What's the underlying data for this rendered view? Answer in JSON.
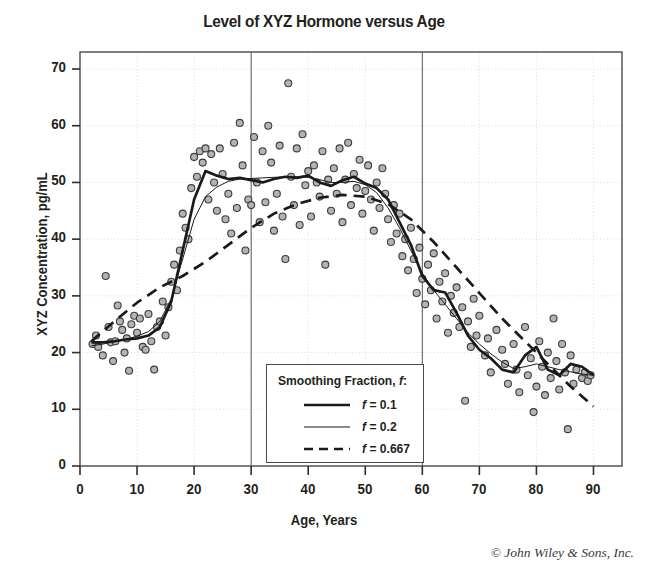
{
  "chart_data": {
    "type": "scatter",
    "title": "Level of XYZ Hormone versus Age",
    "xlabel": "Age, Years",
    "ylabel": "XYZ Concentration, pg/mL",
    "xlim": [
      0,
      95
    ],
    "ylim": [
      0,
      73
    ],
    "xticks": [
      0,
      10,
      20,
      30,
      40,
      50,
      60,
      70,
      80,
      90
    ],
    "yticks": [
      0,
      10,
      20,
      30,
      40,
      50,
      60,
      70
    ],
    "grid": true,
    "legend_position": "lower-center",
    "credit": "© John Wiley & Sons, Inc.",
    "marker": {
      "shape": "circle",
      "fill": "#b3b3b3",
      "edge": "#3c3c3c",
      "size": 7
    },
    "legend": {
      "title": "Smoothing Fraction, f:",
      "title_plain": "Smoothing Fraction, ",
      "title_italic": "f",
      "title_suffix": ":",
      "entries": [
        {
          "label": "f = 0.1",
          "italic": "f",
          "rest": " = 0.1",
          "style": "thick-solid",
          "width": 2.6,
          "dash": "none"
        },
        {
          "label": "f = 0.2",
          "italic": "f",
          "rest": " = 0.2",
          "style": "thin-solid",
          "width": 1.0,
          "dash": "none"
        },
        {
          "label": "f = 0.667",
          "italic": "f",
          "rest": " = 0.667",
          "style": "dashed",
          "width": 2.6,
          "dash": "9 6"
        }
      ]
    },
    "scatter": [
      [
        2.2,
        21.5
      ],
      [
        2.8,
        23.0
      ],
      [
        3.2,
        21.0
      ],
      [
        4.0,
        19.5
      ],
      [
        4.5,
        33.5
      ],
      [
        5.0,
        24.5
      ],
      [
        5.4,
        21.8
      ],
      [
        5.8,
        18.5
      ],
      [
        6.2,
        22.0
      ],
      [
        6.6,
        28.3
      ],
      [
        7.0,
        25.5
      ],
      [
        7.4,
        24.0
      ],
      [
        7.8,
        20.0
      ],
      [
        8.2,
        22.5
      ],
      [
        8.6,
        16.8
      ],
      [
        9.0,
        25.0
      ],
      [
        9.5,
        26.5
      ],
      [
        10.0,
        23.5
      ],
      [
        10.5,
        26.0
      ],
      [
        11.0,
        21.0
      ],
      [
        11.5,
        20.5
      ],
      [
        12.0,
        26.8
      ],
      [
        12.5,
        22.0
      ],
      [
        13.0,
        17.0
      ],
      [
        13.5,
        24.5
      ],
      [
        14.0,
        25.5
      ],
      [
        14.5,
        29.0
      ],
      [
        15.0,
        23.0
      ],
      [
        15.5,
        28.0
      ],
      [
        16.0,
        32.5
      ],
      [
        16.5,
        35.5
      ],
      [
        17.0,
        31.0
      ],
      [
        17.5,
        38.0
      ],
      [
        18.0,
        44.5
      ],
      [
        18.5,
        42.0
      ],
      [
        19.0,
        40.0
      ],
      [
        19.5,
        49.0
      ],
      [
        20.0,
        54.5
      ],
      [
        20.5,
        51.0
      ],
      [
        21.0,
        55.5
      ],
      [
        21.5,
        53.5
      ],
      [
        22.0,
        56.0
      ],
      [
        22.5,
        47.0
      ],
      [
        23.0,
        55.0
      ],
      [
        23.5,
        50.0
      ],
      [
        24.0,
        45.0
      ],
      [
        24.5,
        56.0
      ],
      [
        25.0,
        51.5
      ],
      [
        25.5,
        43.5
      ],
      [
        26.0,
        48.0
      ],
      [
        26.5,
        41.0
      ],
      [
        27.0,
        57.0
      ],
      [
        27.5,
        45.5
      ],
      [
        28.0,
        60.5
      ],
      [
        28.5,
        53.0
      ],
      [
        29.0,
        38.0
      ],
      [
        29.5,
        47.0
      ],
      [
        30.0,
        46.0
      ],
      [
        30.5,
        58.0
      ],
      [
        31.0,
        50.0
      ],
      [
        31.5,
        43.0
      ],
      [
        32.0,
        55.5
      ],
      [
        32.5,
        46.5
      ],
      [
        33.0,
        60.0
      ],
      [
        33.5,
        53.5
      ],
      [
        34.0,
        41.5
      ],
      [
        34.5,
        48.0
      ],
      [
        35.0,
        56.5
      ],
      [
        35.5,
        44.0
      ],
      [
        36.0,
        36.5
      ],
      [
        36.5,
        67.5
      ],
      [
        37.0,
        51.0
      ],
      [
        37.5,
        46.0
      ],
      [
        38.0,
        56.0
      ],
      [
        38.5,
        42.5
      ],
      [
        39.0,
        58.5
      ],
      [
        39.5,
        49.5
      ],
      [
        40.0,
        52.0
      ],
      [
        40.5,
        44.0
      ],
      [
        41.0,
        53.0
      ],
      [
        41.5,
        50.0
      ],
      [
        42.0,
        47.5
      ],
      [
        42.5,
        55.5
      ],
      [
        43.0,
        35.5
      ],
      [
        43.5,
        50.5
      ],
      [
        44.0,
        45.0
      ],
      [
        44.5,
        52.5
      ],
      [
        45.0,
        48.0
      ],
      [
        45.5,
        56.0
      ],
      [
        46.0,
        43.0
      ],
      [
        46.5,
        50.5
      ],
      [
        47.0,
        57.0
      ],
      [
        47.5,
        46.0
      ],
      [
        48.0,
        51.5
      ],
      [
        48.5,
        49.0
      ],
      [
        49.0,
        54.0
      ],
      [
        49.5,
        44.5
      ],
      [
        50.0,
        48.5
      ],
      [
        50.5,
        53.0
      ],
      [
        51.0,
        47.0
      ],
      [
        51.5,
        41.5
      ],
      [
        52.0,
        50.0
      ],
      [
        52.5,
        45.5
      ],
      [
        53.0,
        52.5
      ],
      [
        53.5,
        48.0
      ],
      [
        54.0,
        43.5
      ],
      [
        54.5,
        39.5
      ],
      [
        55.0,
        46.0
      ],
      [
        55.5,
        41.0
      ],
      [
        56.0,
        44.5
      ],
      [
        56.5,
        37.0
      ],
      [
        57.0,
        40.0
      ],
      [
        57.5,
        34.5
      ],
      [
        58.0,
        42.0
      ],
      [
        58.5,
        36.5
      ],
      [
        59.0,
        30.5
      ],
      [
        59.5,
        38.5
      ],
      [
        60.0,
        33.0
      ],
      [
        60.5,
        28.5
      ],
      [
        61.0,
        35.5
      ],
      [
        61.5,
        31.0
      ],
      [
        62.0,
        37.5
      ],
      [
        62.5,
        26.0
      ],
      [
        63.0,
        32.5
      ],
      [
        63.5,
        29.0
      ],
      [
        64.0,
        34.0
      ],
      [
        64.5,
        23.5
      ],
      [
        65.0,
        30.0
      ],
      [
        65.5,
        27.0
      ],
      [
        66.0,
        31.5
      ],
      [
        66.5,
        24.5
      ],
      [
        67.0,
        28.0
      ],
      [
        67.5,
        11.5
      ],
      [
        68.0,
        25.5
      ],
      [
        68.5,
        21.0
      ],
      [
        69.0,
        29.5
      ],
      [
        69.5,
        23.0
      ],
      [
        70.0,
        26.5
      ],
      [
        71.0,
        19.5
      ],
      [
        71.5,
        22.5
      ],
      [
        72.0,
        16.5
      ],
      [
        73.0,
        24.0
      ],
      [
        74.0,
        20.5
      ],
      [
        74.5,
        18.0
      ],
      [
        75.0,
        14.5
      ],
      [
        76.0,
        21.5
      ],
      [
        76.5,
        17.0
      ],
      [
        77.0,
        13.0
      ],
      [
        78.0,
        24.5
      ],
      [
        78.5,
        16.0
      ],
      [
        79.0,
        19.0
      ],
      [
        79.5,
        9.5
      ],
      [
        80.0,
        14.0
      ],
      [
        80.5,
        22.0
      ],
      [
        81.0,
        17.5
      ],
      [
        81.5,
        12.5
      ],
      [
        82.0,
        20.0
      ],
      [
        82.5,
        15.5
      ],
      [
        83.0,
        26.0
      ],
      [
        83.5,
        18.5
      ],
      [
        84.0,
        13.5
      ],
      [
        84.5,
        21.5
      ],
      [
        85.0,
        16.5
      ],
      [
        85.5,
        6.5
      ],
      [
        86.0,
        19.5
      ],
      [
        86.5,
        14.5
      ],
      [
        87.0,
        17.0
      ],
      [
        88.0,
        15.5
      ],
      [
        88.5,
        16.5
      ],
      [
        89.0,
        15.0
      ],
      [
        89.5,
        16.0
      ]
    ],
    "series": [
      {
        "name": "f = 0.1",
        "style": "thick-solid",
        "points": [
          [
            2,
            21.8
          ],
          [
            4,
            21.8
          ],
          [
            6,
            22.0
          ],
          [
            8,
            22.3
          ],
          [
            10,
            22.5
          ],
          [
            12,
            23.0
          ],
          [
            14,
            24.5
          ],
          [
            16,
            29.0
          ],
          [
            18,
            38.0
          ],
          [
            20,
            47.0
          ],
          [
            22,
            52.0
          ],
          [
            24,
            51.2
          ],
          [
            26,
            50.6
          ],
          [
            28,
            50.8
          ],
          [
            30,
            50.4
          ],
          [
            32,
            50.0
          ],
          [
            34,
            50.6
          ],
          [
            36,
            51.0
          ],
          [
            38,
            50.8
          ],
          [
            40,
            51.2
          ],
          [
            42,
            50.0
          ],
          [
            44,
            49.4
          ],
          [
            46,
            50.4
          ],
          [
            48,
            51.0
          ],
          [
            50,
            49.8
          ],
          [
            52,
            49.0
          ],
          [
            54,
            47.0
          ],
          [
            56,
            43.0
          ],
          [
            58,
            39.0
          ],
          [
            60,
            33.5
          ],
          [
            62,
            31.0
          ],
          [
            64,
            30.6
          ],
          [
            66,
            27.0
          ],
          [
            68,
            23.0
          ],
          [
            70,
            20.5
          ],
          [
            72,
            19.0
          ],
          [
            74,
            17.0
          ],
          [
            76,
            16.5
          ],
          [
            78,
            19.5
          ],
          [
            80,
            21.0
          ],
          [
            82,
            17.0
          ],
          [
            84,
            16.0
          ],
          [
            86,
            18.0
          ],
          [
            88,
            17.5
          ],
          [
            90,
            16.0
          ]
        ]
      },
      {
        "name": "f = 0.2",
        "style": "thin-solid",
        "points": [
          [
            2,
            21.2
          ],
          [
            4,
            21.5
          ],
          [
            6,
            21.9
          ],
          [
            8,
            22.3
          ],
          [
            10,
            22.9
          ],
          [
            12,
            23.7
          ],
          [
            14,
            25.5
          ],
          [
            16,
            29.5
          ],
          [
            18,
            36.5
          ],
          [
            20,
            43.5
          ],
          [
            22,
            47.5
          ],
          [
            24,
            49.2
          ],
          [
            26,
            50.2
          ],
          [
            28,
            50.6
          ],
          [
            30,
            50.7
          ],
          [
            32,
            50.8
          ],
          [
            34,
            50.9
          ],
          [
            36,
            51.0
          ],
          [
            38,
            51.0
          ],
          [
            40,
            50.9
          ],
          [
            42,
            50.5
          ],
          [
            44,
            50.0
          ],
          [
            46,
            50.0
          ],
          [
            48,
            50.2
          ],
          [
            50,
            49.6
          ],
          [
            52,
            48.2
          ],
          [
            54,
            45.5
          ],
          [
            56,
            42.0
          ],
          [
            58,
            38.0
          ],
          [
            60,
            34.0
          ],
          [
            62,
            31.0
          ],
          [
            64,
            28.5
          ],
          [
            66,
            26.0
          ],
          [
            68,
            23.5
          ],
          [
            70,
            21.5
          ],
          [
            72,
            19.8
          ],
          [
            74,
            18.3
          ],
          [
            76,
            17.2
          ],
          [
            78,
            17.5
          ],
          [
            80,
            18.0
          ],
          [
            82,
            17.5
          ],
          [
            84,
            17.0
          ],
          [
            86,
            16.6
          ],
          [
            88,
            16.2
          ],
          [
            90,
            16.0
          ]
        ]
      },
      {
        "name": "f = 0.667",
        "style": "dashed",
        "points": [
          [
            2,
            22.0
          ],
          [
            6,
            25.5
          ],
          [
            10,
            28.8
          ],
          [
            14,
            31.5
          ],
          [
            18,
            33.5
          ],
          [
            22,
            36.0
          ],
          [
            26,
            39.0
          ],
          [
            30,
            42.0
          ],
          [
            34,
            44.5
          ],
          [
            38,
            46.2
          ],
          [
            42,
            47.3
          ],
          [
            46,
            47.8
          ],
          [
            50,
            47.5
          ],
          [
            54,
            46.2
          ],
          [
            58,
            43.5
          ],
          [
            62,
            39.5
          ],
          [
            66,
            35.0
          ],
          [
            70,
            30.5
          ],
          [
            74,
            26.0
          ],
          [
            78,
            22.0
          ],
          [
            82,
            18.0
          ],
          [
            86,
            14.0
          ],
          [
            90,
            10.5
          ]
        ]
      }
    ]
  }
}
